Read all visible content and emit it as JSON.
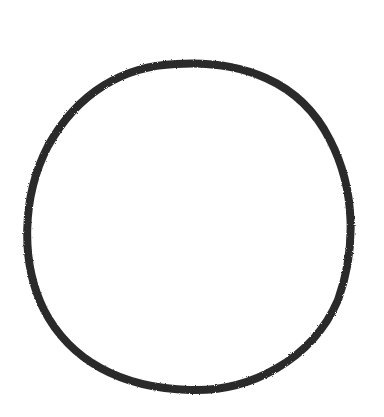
{
  "canvas": {
    "width": 384,
    "height": 417,
    "background": "#ffffff"
  },
  "shape": {
    "type": "circle",
    "style": "hand-drawn",
    "cx": 188,
    "cy": 226,
    "rx": 162,
    "ry": 163,
    "stroke": "#2b2b2b",
    "stroke_width": 8,
    "fill": "none"
  }
}
